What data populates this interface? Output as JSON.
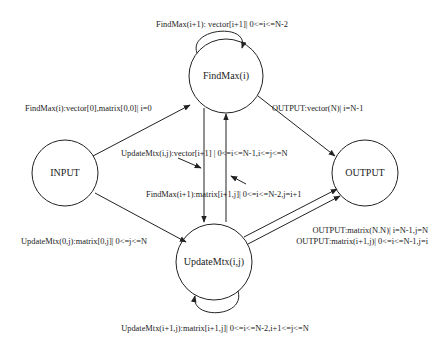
{
  "nodes": {
    "findmax": {
      "label": "FindMax(i)",
      "cx": 226,
      "cy": 76,
      "r": 37
    },
    "input": {
      "label": "INPUT",
      "cx": 65,
      "cy": 173,
      "r": 33
    },
    "output": {
      "label": "OUTPUT",
      "cx": 365,
      "cy": 173,
      "r": 33
    },
    "update": {
      "label": "UpdateMtx(i,j)",
      "cx": 214,
      "cy": 262,
      "r": 38
    }
  },
  "edges": {
    "findmax_self": "FindMax(i+1): vector[i+1]| 0<=i<=N-2",
    "input_to_findmax": "FindMax(i):vector[0],matrix[0,0]| i=0",
    "findmax_to_output": "OUTPUT:vector(N)| i=N-1",
    "findmax_to_update": "UpdateMtx(i,j):vector[i+1] | 0<=i<=N-1,i<=j<=N",
    "update_to_findmax": "FindMax(i+1):matrix[i+1,j]| 0<=i<=N-2,j=i+1",
    "input_to_update": "UpdateMtx(0,j):matrix[0,j]| 0<=j<=N",
    "update_to_output_1": "OUTPUT:matrix(N.N)| i=N-1,j=N",
    "update_to_output_2": "OUTPUT:matrix(i+1,j)| 0<=i<=N-1,j=i",
    "update_self": "UpdateMtx(i+1,j):matrix[i+1,j]| 0<=i<=N-2,i+1<=j<=N"
  },
  "colors": {
    "stroke": "#222222",
    "background": "#ffffff"
  }
}
